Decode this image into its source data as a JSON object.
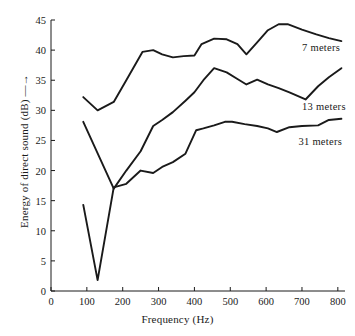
{
  "chart_data": {
    "type": "line",
    "title": "",
    "xlabel": "Frequency (Hz)",
    "ylabel": "Energy of direct sound (dB) —→",
    "xlim": [
      0,
      820
    ],
    "ylim": [
      0,
      45
    ],
    "xticks": [
      0,
      100,
      200,
      300,
      400,
      500,
      600,
      700,
      800
    ],
    "yticks": [
      0,
      5,
      10,
      15,
      20,
      25,
      30,
      35,
      40,
      45
    ],
    "grid": false,
    "legend_position": "inline-right",
    "line_color": "#1a1a1a",
    "background_color": "#ffffff",
    "series": [
      {
        "name": "7 meters",
        "label": "7 meters",
        "label_x": 700,
        "label_y": 40.2,
        "x": [
          90,
          130,
          175,
          210,
          255,
          285,
          310,
          340,
          370,
          400,
          420,
          455,
          490,
          520,
          545,
          575,
          605,
          635,
          660,
          700,
          740,
          775,
          810
        ],
        "y": [
          32.2,
          30.0,
          31.4,
          35.0,
          39.7,
          40.0,
          39.3,
          38.8,
          39.0,
          39.1,
          41.0,
          41.9,
          41.8,
          41.0,
          39.3,
          41.3,
          43.3,
          44.3,
          44.3,
          43.4,
          42.6,
          42.0,
          41.5
        ]
      },
      {
        "name": "13 meters",
        "label": "13 meters",
        "label_x": 700,
        "label_y": 30.4,
        "x": [
          90,
          175,
          210,
          250,
          285,
          310,
          340,
          375,
          400,
          425,
          455,
          490,
          520,
          545,
          575,
          605,
          635,
          665,
          710,
          745,
          775,
          810
        ],
        "y": [
          28.1,
          17.0,
          20.0,
          23.2,
          27.4,
          28.4,
          29.7,
          31.6,
          33.0,
          35.0,
          37.0,
          36.3,
          35.2,
          34.3,
          35.1,
          34.3,
          33.7,
          33.0,
          31.8,
          34.0,
          35.5,
          37.0
        ]
      },
      {
        "name": "31 meters",
        "label": "31 meters",
        "label_x": 690,
        "label_y": 24.5,
        "x": [
          90,
          130,
          175,
          210,
          250,
          285,
          310,
          340,
          375,
          405,
          425,
          455,
          485,
          505,
          540,
          575,
          605,
          630,
          665,
          700,
          745,
          775,
          810
        ],
        "y": [
          14.3,
          1.8,
          17.2,
          17.8,
          20.0,
          19.6,
          20.6,
          21.4,
          22.8,
          26.7,
          27.0,
          27.5,
          28.1,
          28.1,
          27.7,
          27.4,
          27.0,
          26.4,
          27.2,
          27.4,
          27.5,
          28.4,
          28.6
        ]
      }
    ]
  },
  "axes": {
    "x_title": "Frequency (Hz)",
    "y_title": "Energy of direct sound (dB)",
    "y_title_arrow": "⟶",
    "x_tick_labels": [
      "0",
      "100",
      "200",
      "300",
      "400",
      "500",
      "600",
      "700",
      "800"
    ],
    "y_tick_labels": [
      "0",
      "5",
      "10",
      "15",
      "20",
      "25",
      "30",
      "35",
      "40",
      "45"
    ]
  }
}
